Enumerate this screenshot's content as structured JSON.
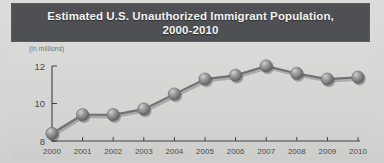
{
  "header": {
    "title_line1": "Estimated U.S. Unauthorized Immigrant Population,",
    "title_line2": "2000-2010",
    "band_color": "#4f5053",
    "title_color": "#f2f2f0"
  },
  "axes": {
    "units_label": "(in millions)",
    "y_ticks": [
      "8",
      "10",
      "12"
    ],
    "x_ticks": [
      "2000",
      "2001",
      "2002",
      "2003",
      "2004",
      "2005",
      "2006",
      "2007",
      "2008",
      "2009",
      "2010"
    ]
  },
  "chart_data": {
    "type": "line",
    "title": "Estimated U.S. Unauthorized Immigrant Population, 2000-2010",
    "xlabel": "",
    "ylabel": "(in millions)",
    "categories": [
      "2000",
      "2001",
      "2002",
      "2003",
      "2004",
      "2005",
      "2006",
      "2007",
      "2008",
      "2009",
      "2010"
    ],
    "x": [
      2000,
      2001,
      2002,
      2003,
      2004,
      2005,
      2006,
      2007,
      2008,
      2009,
      2010
    ],
    "values": [
      8.4,
      9.4,
      9.4,
      9.7,
      10.5,
      11.3,
      11.5,
      12.0,
      11.6,
      11.3,
      11.4
    ],
    "series": [
      {
        "name": "Unauthorized immigrant population",
        "values": [
          8.4,
          9.4,
          9.4,
          9.7,
          10.5,
          11.3,
          11.5,
          12.0,
          11.6,
          11.3,
          11.4
        ]
      }
    ],
    "ylim": [
      8,
      12
    ],
    "yticks": [
      8,
      10,
      12
    ],
    "grid": false,
    "legend": null,
    "legend_position": "none",
    "marker": "sphere",
    "line_color": "#6f7174",
    "marker_color": "#8d8f91",
    "annotations": []
  }
}
